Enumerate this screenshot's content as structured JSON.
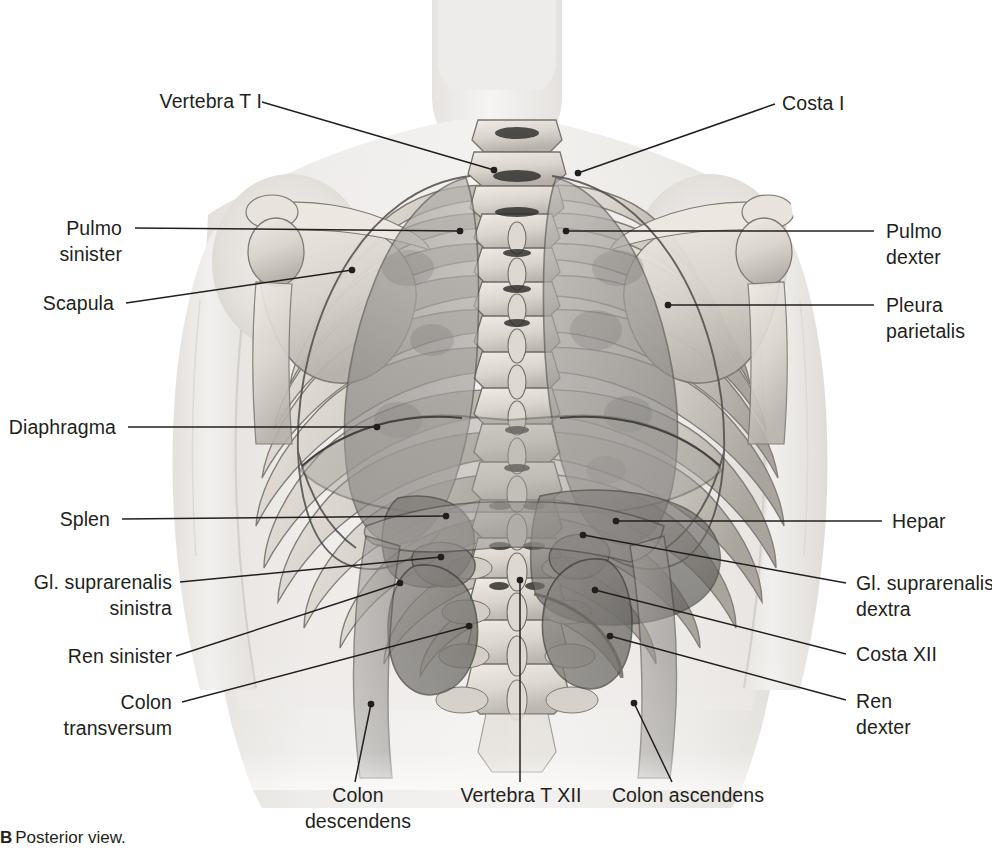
{
  "figure": {
    "caption_letter": "B",
    "caption_text": "Posterior view.",
    "view": "Posterior view"
  },
  "colors": {
    "text": "#231f20",
    "leader_line": "#231f20",
    "skin_light": "#f1efed",
    "skin_mid": "#e3e0dc",
    "bone_light": "#e9e5df",
    "bone_mid": "#c9c4bc",
    "bone_shadow": "#8d8a85",
    "organ_mid": "#9b9894",
    "organ_dark": "#6f6c69",
    "organ_darkest": "#4d4b49",
    "lung_fill": "#a5a29e",
    "pleura_line": "#6b6967",
    "background": "#ffffff"
  },
  "labels": {
    "left": [
      {
        "id": "vertebra-t-i",
        "text": "Vertebra T I"
      },
      {
        "id": "pulmo-sinister",
        "text": "Pulmo\nsinister"
      },
      {
        "id": "scapula",
        "text": "Scapula"
      },
      {
        "id": "diaphragma",
        "text": "Diaphragma"
      },
      {
        "id": "splen",
        "text": "Splen"
      },
      {
        "id": "gl-suprarenalis-sinistra",
        "text": "Gl. suprarenalis\nsinistra"
      },
      {
        "id": "ren-sinister",
        "text": "Ren sinister"
      },
      {
        "id": "colon-transversum",
        "text": "Colon\ntransversum"
      }
    ],
    "right": [
      {
        "id": "costa-i",
        "text": "Costa I"
      },
      {
        "id": "pulmo-dexter",
        "text": "Pulmo\ndexter"
      },
      {
        "id": "pleura-parietalis",
        "text": "Pleura\nparietalis"
      },
      {
        "id": "hepar",
        "text": "Hepar"
      },
      {
        "id": "gl-suprarenalis-dextra",
        "text": "Gl. suprarenalis\ndextra"
      },
      {
        "id": "costa-xii",
        "text": "Costa XII"
      },
      {
        "id": "ren-dexter",
        "text": "Ren\ndexter"
      }
    ],
    "bottom": [
      {
        "id": "colon-descendens",
        "text": "Colon\ndescendens"
      },
      {
        "id": "vertebra-t-xii",
        "text": "Vertebra T XII"
      },
      {
        "id": "colon-ascendens",
        "text": "Colon ascendens"
      }
    ]
  }
}
